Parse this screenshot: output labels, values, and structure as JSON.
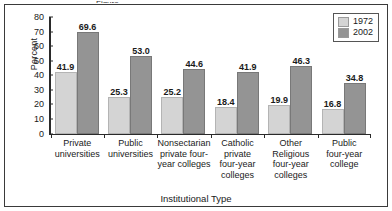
{
  "chart_data": {
    "type": "bar",
    "title": "",
    "xlabel": "Institutional Type",
    "ylabel": "Percent",
    "ylim": [
      0,
      80
    ],
    "yticks": [
      0,
      10,
      20,
      30,
      40,
      50,
      60,
      70,
      80
    ],
    "grid": false,
    "legend_position": "top-right",
    "categories": [
      "Private universities",
      "Public universities",
      "Nonsectarian private four-year colleges",
      "Catholic private four-year colleges",
      "Other Religious four-year colleges",
      "Public four-year college"
    ],
    "category_lines": [
      [
        "Private",
        "universities"
      ],
      [
        "Public",
        "universities"
      ],
      [
        "Nonsectarian",
        "private four-",
        "year colleges"
      ],
      [
        "Catholic",
        "private",
        "four-year",
        "colleges"
      ],
      [
        "Other",
        "Religious",
        "four-year",
        "colleges"
      ],
      [
        "Public",
        "four-year",
        "college"
      ]
    ],
    "series": [
      {
        "name": "1972",
        "color": "#d4d4d4",
        "values": [
          41.9,
          25.3,
          25.2,
          18.4,
          19.9,
          16.8
        ],
        "labels": [
          "41.9",
          "25.3",
          "25.2",
          "18.4",
          "19.9",
          "16.8"
        ]
      },
      {
        "name": "2002",
        "color": "#949494",
        "values": [
          69.6,
          53.0,
          44.6,
          41.9,
          46.3,
          34.8
        ],
        "labels": [
          "69.6",
          "53.0",
          "44.6",
          "41.9",
          "46.3",
          "34.8"
        ]
      }
    ]
  },
  "legend": {
    "entries": [
      {
        "label": "1972"
      },
      {
        "label": "2002"
      }
    ]
  },
  "figure": {
    "title_sliver": "Figure"
  }
}
